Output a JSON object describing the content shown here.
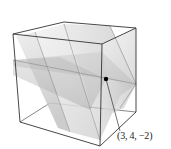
{
  "figure": {
    "point": {
      "label": "(3, 4, −2)",
      "coords": [
        3,
        4,
        -2
      ]
    },
    "colors": {
      "edge": "#3a3a3a",
      "plane_light": "#e6e6e6",
      "plane_mid": "#cfcfcf",
      "plane_dark": "#b5b5b5",
      "point": "#000000",
      "background": "#ffffff"
    }
  }
}
